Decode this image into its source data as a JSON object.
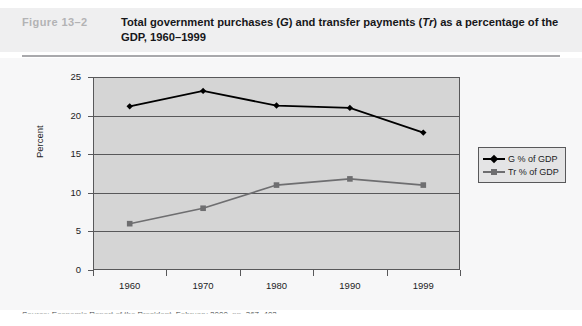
{
  "figure": {
    "label": "Figure  13–2",
    "title_part1": "Total government purchases (",
    "title_italic1": "G",
    "title_part2": ") and transfer payments (",
    "title_italic2": "Tr",
    "title_part3": ") as a percentage of the GDP, 1960–1999"
  },
  "source": {
    "text": "Source: Economic Report of the President, February 2000, pp. 367, 402."
  },
  "legend": {
    "items": [
      {
        "label": "G % of GDP",
        "marker": "diamond-marker-icon",
        "color": "#000000"
      },
      {
        "label": "Tr % of GDP",
        "marker": "square-marker-icon",
        "color": "#6e6e70"
      }
    ]
  },
  "colors": {
    "plot_background": "#d5d5d5",
    "axis": "#58585a",
    "series_g": "#000000",
    "series_tr": "#6e6e70",
    "header_band": "#efeff0",
    "figure_label": "#b3b3b5"
  },
  "chart_data": {
    "type": "line",
    "title": "Total government purchases (G) and transfer payments (Tr) as a percentage of the GDP, 1960–1999",
    "xlabel": "",
    "ylabel": "Percent",
    "categories": [
      "1960",
      "1970",
      "1980",
      "1990",
      "1999"
    ],
    "x_tick_labels": [
      "1960",
      "1970",
      "1980",
      "1990",
      "1999"
    ],
    "y_tick_labels": [
      "0",
      "5",
      "10",
      "15",
      "20",
      "25"
    ],
    "ylim": [
      0,
      25
    ],
    "y_ticks": [
      0,
      5,
      10,
      15,
      20,
      25
    ],
    "grid": true,
    "legend_position": "right",
    "series": [
      {
        "name": "G % of GDP",
        "values": [
          21.2,
          23.2,
          21.3,
          21.0,
          17.8
        ],
        "color": "#000000",
        "marker": "diamond"
      },
      {
        "name": "Tr % of GDP",
        "values": [
          6.0,
          8.0,
          11.0,
          11.8,
          11.0
        ],
        "color": "#6e6e70",
        "marker": "square"
      }
    ]
  }
}
